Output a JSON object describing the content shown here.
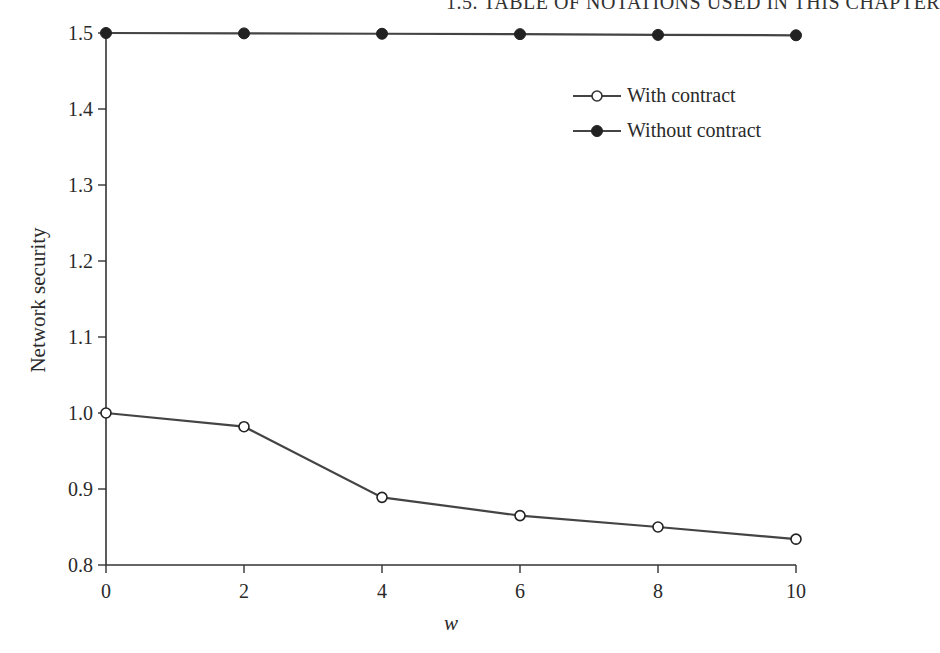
{
  "page": {
    "running_head": "1.5. TABLE OF NOTATIONS USED IN THIS CHAPTER"
  },
  "chart_data": {
    "type": "line",
    "title": "",
    "xlabel": "w",
    "ylabel": "Network security",
    "x": [
      0,
      2,
      4,
      6,
      8,
      10
    ],
    "xlim": [
      0,
      10
    ],
    "ylim": [
      0.8,
      1.5
    ],
    "x_ticks": [
      0,
      2,
      4,
      6,
      8,
      10
    ],
    "x_tick_labels": [
      "0",
      "2",
      "4",
      "6",
      "8",
      "10"
    ],
    "y_ticks": [
      0.8,
      0.9,
      1.0,
      1.1,
      1.2,
      1.3,
      1.4,
      1.5
    ],
    "y_tick_labels": [
      "0.8",
      "0.9",
      "1.0",
      "1.1",
      "1.2",
      "1.3",
      "1.4",
      "1.5"
    ],
    "grid": false,
    "legend_position": "upper right",
    "series": [
      {
        "name": "With contract",
        "marker": "open-circle",
        "values": [
          1.0,
          0.982,
          0.889,
          0.865,
          0.85,
          0.834
        ]
      },
      {
        "name": "Without contract",
        "marker": "filled-circle",
        "values": [
          1.5,
          1.4995,
          1.499,
          1.4985,
          1.4975,
          1.497
        ]
      }
    ],
    "colors": {
      "line": "#444444",
      "marker": "#222222",
      "axis": "#333333"
    }
  }
}
